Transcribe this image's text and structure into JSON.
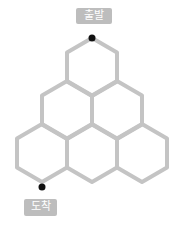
{
  "labels": {
    "start": "출발",
    "end": "도착"
  },
  "colors": {
    "edge": "#c4c4c4",
    "dot": "#111111",
    "label_bg": "#bdbdbd",
    "label_text": "#ffffff"
  },
  "hexagons": [
    {
      "row": 1,
      "cx": 92,
      "cy": 67
    },
    {
      "row": 2,
      "cx": 67,
      "cy": 110
    },
    {
      "row": 2,
      "cx": 117,
      "cy": 110
    },
    {
      "row": 3,
      "cx": 42,
      "cy": 153
    },
    {
      "row": 3,
      "cx": 92,
      "cy": 153
    },
    {
      "row": 3,
      "cx": 142,
      "cy": 153
    }
  ],
  "points": {
    "start": {
      "x": 92,
      "y": 38
    },
    "end": {
      "x": 42,
      "y": 187
    }
  }
}
